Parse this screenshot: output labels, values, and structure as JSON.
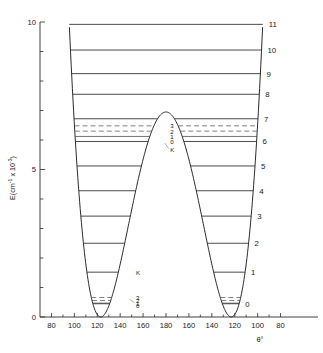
{
  "figure": {
    "name": "double-well-potential-energy-level-diagram",
    "y_axis": {
      "title": "E(cm",
      "title_sup1": "-1",
      "title_mid": " x 10",
      "title_sup2": "-3",
      "title_end": ")",
      "ticks": [
        {
          "value": 0,
          "label": "0"
        },
        {
          "value": 1,
          "label": ""
        },
        {
          "value": 2,
          "label": ""
        },
        {
          "value": 3,
          "label": ""
        },
        {
          "value": 4,
          "label": ""
        },
        {
          "value": 5,
          "label": "5"
        },
        {
          "value": 6,
          "label": ""
        },
        {
          "value": 7,
          "label": ""
        },
        {
          "value": 8,
          "label": ""
        },
        {
          "value": 9,
          "label": ""
        },
        {
          "value": 10,
          "label": "10"
        }
      ],
      "range": [
        0,
        10
      ]
    },
    "x_axis": {
      "title": "θ°",
      "tick_labels": [
        "80",
        "100",
        "120",
        "140",
        "160",
        "180",
        "160",
        "140",
        "120",
        "100",
        "80"
      ],
      "tick_values": [
        80,
        100,
        120,
        140,
        160,
        180,
        200,
        220,
        240,
        260,
        280
      ],
      "range": [
        70,
        290
      ]
    },
    "vibrational_labels": [
      "0",
      "1",
      "2",
      "3",
      "4",
      "5",
      "6",
      "7",
      "8",
      "9",
      "10",
      "11"
    ],
    "k_labels_upper": [
      "3",
      "2",
      "1",
      "0",
      "K"
    ],
    "k_labels_lower": [
      "K",
      "3",
      "2",
      "1",
      "0"
    ]
  },
  "chart_data": {
    "type": "line",
    "title": "",
    "xlabel": "θ°",
    "ylabel": "E(cm-1 x 10-3)",
    "xlim": [
      70,
      290
    ],
    "ylim": [
      0,
      10
    ],
    "grid": false,
    "legend": "none",
    "potential_curve": {
      "name": "double-well potential",
      "minimum_left_deg": 123,
      "minimum_right_deg": 237,
      "barrier_center_deg": 180,
      "barrier_height": 6.95,
      "well_depth": 0.0
    },
    "vibrational_levels": [
      {
        "v": "0",
        "energy": 0.45,
        "below_barrier": true,
        "k_sublevels": [
          0.4,
          0.47,
          0.56,
          0.66
        ]
      },
      {
        "v": "1",
        "energy": 1.52,
        "below_barrier": true,
        "k_sublevels": [
          1.52
        ]
      },
      {
        "v": "2",
        "energy": 2.5,
        "below_barrier": true,
        "k_sublevels": [
          2.5
        ]
      },
      {
        "v": "3",
        "energy": 3.42,
        "below_barrier": true,
        "k_sublevels": [
          3.42
        ]
      },
      {
        "v": "4",
        "energy": 4.28,
        "below_barrier": true,
        "k_sublevels": [
          4.28
        ]
      },
      {
        "v": "5",
        "energy": 5.12,
        "below_barrier": true,
        "k_sublevels": [
          5.12
        ]
      },
      {
        "v": "6",
        "energy": 5.95,
        "below_barrier": true,
        "k_sublevels": [
          5.95,
          6.12,
          6.3,
          6.48
        ]
      },
      {
        "v": "7",
        "energy": 6.72,
        "below_barrier": true,
        "k_sublevels": [
          6.72
        ]
      },
      {
        "v": "8",
        "energy": 7.55,
        "below_barrier": false,
        "k_sublevels": [
          7.55
        ]
      },
      {
        "v": "9",
        "energy": 8.25,
        "below_barrier": false,
        "k_sublevels": [
          8.25
        ]
      },
      {
        "v": "10",
        "energy": 9.05,
        "below_barrier": false,
        "k_sublevels": [
          9.05
        ]
      },
      {
        "v": "11",
        "energy": 9.92,
        "below_barrier": false,
        "k_sublevels": [
          9.92
        ]
      }
    ]
  }
}
